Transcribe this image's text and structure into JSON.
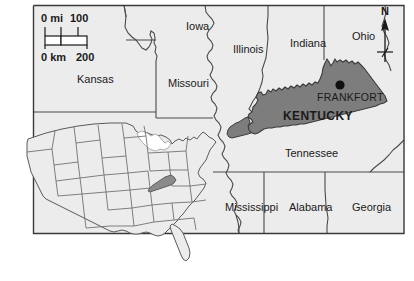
{
  "figure": {
    "kind": "reference-map",
    "subject": "Kentucky",
    "background_color": "#ffffff",
    "land_fill": "#ececec",
    "highlight_fill": "#7d7d7d",
    "inset_highlight_fill": "#8a8a8a",
    "border_color": "#4a4a4a",
    "frame_color": "#3a3a3a",
    "text_color": "#1a1a1a"
  },
  "scale_bar": {
    "miles": {
      "zero_label": "0 mi",
      "max_label": "100"
    },
    "kilometers": {
      "zero_label": "0 km",
      "max_label": "200"
    }
  },
  "compass": {
    "north_label": "N",
    "icon": "north-arrow-icon"
  },
  "highlighted_state": {
    "name": "KENTUCKY",
    "capital": "FRANKFORT",
    "capital_marker": "capital-dot-icon"
  },
  "surrounding_states": [
    {
      "name": "Iowa",
      "x": 186,
      "y": 21
    },
    {
      "name": "Illinois",
      "x": 233,
      "y": 44
    },
    {
      "name": "Indiana",
      "x": 290,
      "y": 38
    },
    {
      "name": "Ohio",
      "x": 352,
      "y": 31
    },
    {
      "name": "Kansas",
      "x": 77,
      "y": 74
    },
    {
      "name": "Missouri",
      "x": 168,
      "y": 78
    },
    {
      "name": "Tennessee",
      "x": 285,
      "y": 148
    },
    {
      "name": "Mississippi",
      "x": 225,
      "y": 202
    },
    {
      "name": "Alabama",
      "x": 289,
      "y": 202
    },
    {
      "name": "Georgia",
      "x": 352,
      "y": 202
    }
  ],
  "inset_map": {
    "name": "united-states-locator-inset",
    "highlighted": "Kentucky"
  }
}
